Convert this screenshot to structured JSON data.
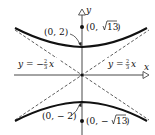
{
  "diagram": {
    "type": "hyperbola",
    "equation_form": "y^2/4 - x^2/9 = 1",
    "axes": {
      "x_label": "x",
      "y_label": "y"
    },
    "vertices": [
      {
        "label": "(0, 2)"
      },
      {
        "label": "(0, − 2)"
      }
    ],
    "foci": [
      {
        "label_prefix": "(0, ",
        "label_root": "13",
        "label_suffix": ")",
        "label": "(0, √13)"
      },
      {
        "label_prefix": "(0, − ",
        "label_root": "13",
        "label_suffix": ")",
        "label": "(0, −√13)"
      }
    ],
    "asymptotes": [
      {
        "label_lhs": "y = −",
        "frac_num": "2",
        "frac_den": "3",
        "var": "x",
        "label": "y = −⅔x"
      },
      {
        "label_lhs": "y = ",
        "frac_num": "2",
        "frac_den": "3",
        "var": "x",
        "label": "y = ⅔x"
      }
    ],
    "colors": {
      "stroke": "#111111",
      "background": "#ffffff"
    }
  }
}
